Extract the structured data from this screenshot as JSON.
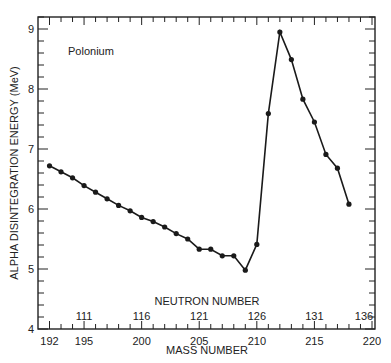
{
  "chart_data": {
    "type": "line",
    "title": "",
    "annotation": "Polonium",
    "xlabel": "MASS NUMBER",
    "x2label": "NEUTRON NUMBER",
    "ylabel": "ALPHA DISINTEGRATION ENERGY (MeV)",
    "xlim": [
      191,
      220.5
    ],
    "ylim": [
      4,
      9.2
    ],
    "x_ticks": [
      192,
      195,
      200,
      205,
      210,
      215,
      220
    ],
    "x2_ticks": [
      {
        "label": "111",
        "at": 195
      },
      {
        "label": "116",
        "at": 200
      },
      {
        "label": "121",
        "at": 205
      },
      {
        "label": "126",
        "at": 210
      },
      {
        "label": "131",
        "at": 215
      },
      {
        "label": "136",
        "at": 220
      }
    ],
    "y_ticks": [
      4,
      5,
      6,
      7,
      8,
      9
    ],
    "grid": false,
    "series": [
      {
        "name": "Polonium",
        "x": [
          192,
          193,
          194,
          195,
          196,
          197,
          198,
          199,
          200,
          201,
          202,
          203,
          204,
          205,
          206,
          207,
          208,
          209,
          210,
          211,
          212,
          213,
          214,
          215,
          216,
          217,
          218
        ],
        "values": [
          6.72,
          6.62,
          6.52,
          6.39,
          6.28,
          6.17,
          6.06,
          5.97,
          5.86,
          5.79,
          5.7,
          5.59,
          5.5,
          5.33,
          5.33,
          5.22,
          5.22,
          4.98,
          5.41,
          7.59,
          8.95,
          8.49,
          7.83,
          7.45,
          6.91,
          6.68,
          6.08
        ]
      }
    ]
  }
}
